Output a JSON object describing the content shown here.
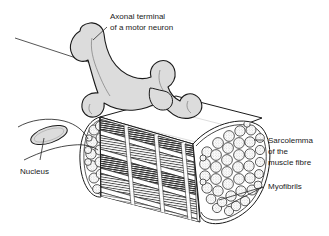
{
  "figure": {
    "background_color": "#ffffff",
    "ink_color": "#1a1a1a",
    "fill_gray": "#d8d8d8",
    "width": 329,
    "height": 236
  },
  "labels": {
    "axonal_terminal": {
      "line1": "Axonal terminal",
      "line2": "of a motor neuron",
      "x": 110,
      "y": 16
    },
    "nucleus": {
      "line1": "Nucleus",
      "x": 20,
      "y": 172
    },
    "sarcolemma": {
      "line1": "Sarcolemma",
      "line2": "of the",
      "line3": "muscle fibre",
      "x": 266,
      "y": 142
    },
    "myofibrils": {
      "line1": "Myofibrils",
      "x": 266,
      "y": 187
    }
  },
  "structures": {
    "axon": "motor-neuron-axon",
    "terminal": "axonal-terminal-branches",
    "fibre": "muscle-fibre-cylinder",
    "cross_section": "myofibril-cross-section",
    "striations": "sarcomere-striations",
    "nucleus_shape": "muscle-cell-nucleus"
  }
}
